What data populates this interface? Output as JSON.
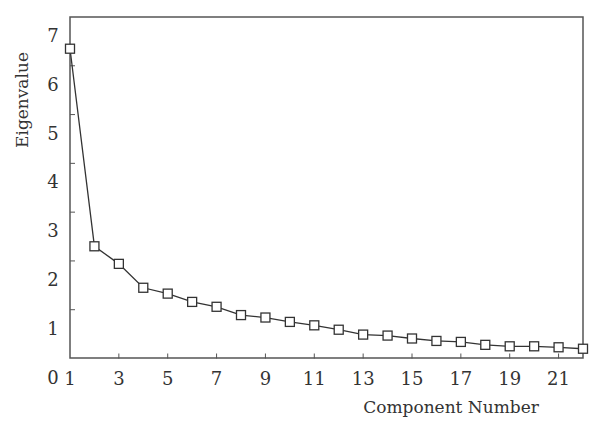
{
  "chart_data": {
    "type": "line",
    "title": "",
    "xlabel": "Component Number",
    "ylabel": "Eigenvalue",
    "x": [
      1,
      2,
      3,
      4,
      5,
      6,
      7,
      8,
      9,
      10,
      11,
      12,
      13,
      14,
      15,
      16,
      17,
      18,
      19,
      20,
      21,
      22
    ],
    "series": [
      {
        "name": "Eigenvalue",
        "marker": "square-open",
        "values": [
          6.35,
          2.3,
          1.94,
          1.45,
          1.33,
          1.16,
          1.06,
          0.89,
          0.84,
          0.75,
          0.68,
          0.59,
          0.49,
          0.47,
          0.41,
          0.36,
          0.34,
          0.28,
          0.25,
          0.25,
          0.23,
          0.2
        ]
      }
    ],
    "xlim": [
      1,
      22
    ],
    "ylim": [
      0,
      7
    ],
    "xticks": [
      1,
      3,
      5,
      7,
      9,
      11,
      13,
      15,
      17,
      19,
      21
    ],
    "yticks": [
      0,
      1,
      2,
      3,
      4,
      5,
      6,
      7
    ],
    "grid": false,
    "legend": null,
    "frame": "box"
  },
  "colors": {
    "line": "#333333",
    "frame": "#555555",
    "background": "#ffffff"
  }
}
